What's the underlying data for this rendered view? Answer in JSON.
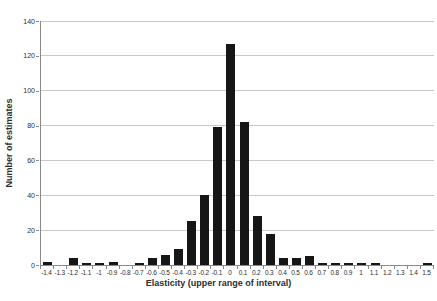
{
  "figure": {
    "background": "#ffffff"
  },
  "chart_data": {
    "type": "bar",
    "title": "",
    "xlabel": "Elasticity (upper range of interval)",
    "ylabel": "Number of estimates",
    "categories": [
      "-1.4",
      "-1.3",
      "-1.2",
      "-1.1",
      "-1",
      "-0.9",
      "-0.8",
      "-0.7",
      "-0.6",
      "-0.5",
      "-0.4",
      "-0.3",
      "-0.2",
      "-0.1",
      "0",
      "0.1",
      "0.2",
      "0.3",
      "0.4",
      "0.5",
      "0.6",
      "0.7",
      "0.8",
      "0.9",
      "1",
      "1.1",
      "1.2",
      "1.3",
      "1.4",
      "1.5"
    ],
    "values": [
      2,
      0,
      4,
      1,
      1,
      2,
      0,
      1,
      4,
      6,
      9,
      25,
      40,
      79,
      127,
      82,
      28,
      18,
      4,
      4,
      5,
      1,
      1,
      1,
      1,
      1,
      0,
      0,
      0,
      1
    ],
    "yticks": [
      0,
      20,
      40,
      60,
      80,
      100,
      120,
      140
    ],
    "ylim": [
      0,
      140
    ],
    "grid": "horizontal",
    "legend": "none",
    "bar_color": "#161616",
    "gridline_color": "#c9c9c9",
    "axis_color": "#8a8a8a",
    "text_color": "#2e2e2e"
  }
}
